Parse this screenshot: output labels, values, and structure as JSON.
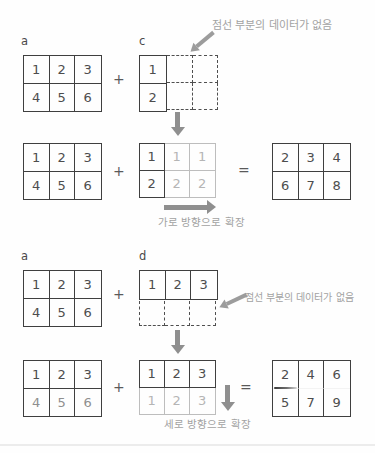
{
  "palette": {
    "line_dark": "#3f3f3f",
    "line_light": "#bdbdbd",
    "digit_dark": "#4d4d4d",
    "digit_light": "#b5b5b5",
    "annotation_gray": "#a2a2a2",
    "arrow_gray": "#8f8f8f"
  },
  "operators": {
    "plus": "+",
    "equals": "="
  },
  "top": {
    "label_a": "a",
    "label_c": "c",
    "note": "점선 부분의 데이터가 없음",
    "expand_label": "가로 방향으로 확장",
    "a1": [
      [
        "1",
        "2",
        "3"
      ],
      [
        "4",
        "5",
        "6"
      ]
    ],
    "c": [
      [
        "1"
      ],
      [
        "2"
      ]
    ],
    "a2": [
      [
        "1",
        "2",
        "3"
      ],
      [
        "4",
        "5",
        "6"
      ]
    ],
    "c_exp": [
      [
        "1",
        "1",
        "1"
      ],
      [
        "2",
        "2",
        "2"
      ]
    ],
    "result": [
      [
        "2",
        "3",
        "4"
      ],
      [
        "6",
        "7",
        "8"
      ]
    ]
  },
  "bottom": {
    "label_a": "a",
    "label_d": "d",
    "note": "점선 부분의 데이터가 없음",
    "expand_label": "세로 방향으로 확장",
    "a1": [
      [
        "1",
        "2",
        "3"
      ],
      [
        "4",
        "5",
        "6"
      ]
    ],
    "d": [
      [
        "1",
        "2",
        "3"
      ]
    ],
    "a2": [
      [
        "1",
        "2",
        "3"
      ],
      [
        "4",
        "5",
        "6"
      ]
    ],
    "d_exp": [
      [
        "1",
        "2",
        "3"
      ],
      [
        "1",
        "2",
        "3"
      ]
    ],
    "result": [
      [
        "2",
        "4",
        "6"
      ],
      [
        "5",
        "7",
        "9"
      ]
    ]
  }
}
